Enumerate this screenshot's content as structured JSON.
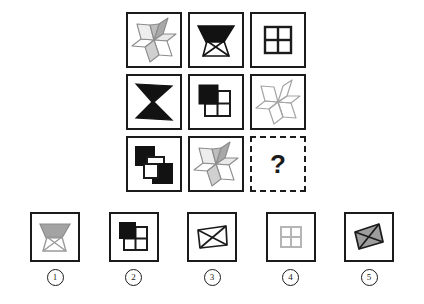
{
  "puzzle": {
    "type": "non-verbal-reasoning-matrix",
    "title": "",
    "unknown_marker": "?",
    "grid_rows": 3,
    "grid_cols": 3,
    "colors": {
      "ink": "#1b1b1b",
      "black_fill": "#121212",
      "gray_fill": "#9d9d9d",
      "light_gray_line": "#b5b5b5",
      "mid_gray_line": "#8c8c8c",
      "background": "#ffffff"
    },
    "cells": [
      {
        "id": "r1c1",
        "shape": "six-point-star-shaded",
        "fill": "gray",
        "description": "Six-pointed star of rhombi, alternating gray and white faces"
      },
      {
        "id": "r1c2",
        "shape": "bowtie-top-filled",
        "fill": "black",
        "description": "Bowtie / hourglass with solid black upper triangle"
      },
      {
        "id": "r1c3",
        "shape": "four-pane-grid",
        "fill": "white",
        "description": "Square divided into four white panes with black frame"
      },
      {
        "id": "r2c1",
        "shape": "bowtie-full",
        "fill": "black",
        "description": "Solid black hourglass / bowtie"
      },
      {
        "id": "r2c2",
        "shape": "four-pane-grid-black-offset",
        "fill": "black",
        "description": "Four-pane grid with offset solid black square at top-left"
      },
      {
        "id": "r2c3",
        "shape": "six-point-star-outline",
        "fill": "none",
        "description": "Six-pointed star of rhombi, outline only in light gray"
      },
      {
        "id": "r3c1",
        "shape": "two-offset-squares",
        "fill": "black",
        "description": "Two black squares offset diagonally with two white squares"
      },
      {
        "id": "r3c2",
        "shape": "six-point-star-shaded",
        "fill": "gray",
        "description": "Six-pointed star of rhombi, alternating gray and white faces"
      },
      {
        "id": "r3c3",
        "shape": "question",
        "fill": "none",
        "description": "Dashed box containing a question mark"
      }
    ],
    "options": [
      {
        "number": "1",
        "shape": "bowtie-top-filled",
        "fill": "gray",
        "description": "Bowtie with gray upper triangle"
      },
      {
        "number": "2",
        "shape": "four-pane-grid-black-offset",
        "fill": "black",
        "description": "Four-pane grid with offset black square at top-left"
      },
      {
        "number": "3",
        "shape": "quad-with-diagonals",
        "fill": "white",
        "description": "White quadrilateral with crossing diagonals"
      },
      {
        "number": "4",
        "shape": "four-pane-grid",
        "fill": "light-gray",
        "description": "Four-pane grid drawn in light gray"
      },
      {
        "number": "5",
        "shape": "quad-with-diagonals",
        "fill": "gray",
        "description": "Gray rhombus with crossing diagonals"
      }
    ]
  }
}
